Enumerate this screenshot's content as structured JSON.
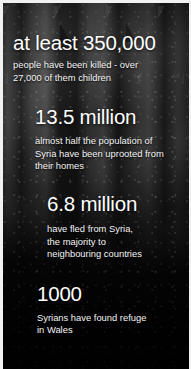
{
  "infographic": {
    "theme": {
      "background_color": "#0a0a0a",
      "headline_color": "#ffffff",
      "body_color": "#f4f4f4",
      "border_color": "#f2f2f2"
    },
    "background_image_alt": "dark photograph of bombed rubble and ruined buildings",
    "stats": [
      {
        "id": "killed",
        "headline": "at least 350,000",
        "body_lines": [
          "people have been killed - over",
          "27,000 of them children"
        ]
      },
      {
        "id": "displaced",
        "headline": "13.5 million",
        "body_lines": [
          "almost half the population of",
          "Syria have been uprooted from",
          "their homes"
        ]
      },
      {
        "id": "fled",
        "headline": "6.8 million",
        "body_lines": [
          "have fled from Syria,",
          "the majority to",
          "neighbouring countries"
        ]
      },
      {
        "id": "wales",
        "headline": "1000",
        "body_lines": [
          "Syrians have found refuge",
          "in Wales"
        ]
      }
    ]
  }
}
